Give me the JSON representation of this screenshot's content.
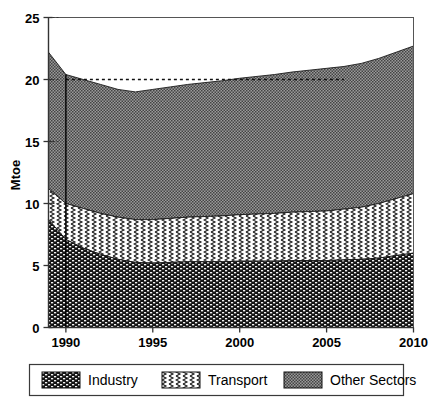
{
  "chart_data": {
    "type": "area",
    "stacked": true,
    "title": "",
    "xlabel": "",
    "ylabel": "Mtoe",
    "xlim": [
      1989,
      2010
    ],
    "ylim": [
      0,
      25
    ],
    "yticks": [
      0,
      5,
      10,
      15,
      20,
      25
    ],
    "xticks": [
      1990,
      1995,
      2000,
      2005,
      2010
    ],
    "grid": false,
    "legend_position": "bottom",
    "x": [
      1989,
      1990,
      1991,
      1992,
      1993,
      1994,
      1995,
      1996,
      1997,
      1998,
      1999,
      2000,
      2001,
      2002,
      2003,
      2004,
      2005,
      2006,
      2007,
      2008,
      2009,
      2010
    ],
    "series": [
      {
        "name": "Industry",
        "pattern": "dark-brick",
        "color": "#2b2b2b",
        "values": [
          8.7,
          7.1,
          6.4,
          5.9,
          5.5,
          5.25,
          5.2,
          5.25,
          5.3,
          5.3,
          5.3,
          5.35,
          5.35,
          5.35,
          5.4,
          5.4,
          5.4,
          5.45,
          5.5,
          5.6,
          5.8,
          6.0
        ]
      },
      {
        "name": "Transport",
        "pattern": "white-zigzag",
        "color": "#ffffff",
        "values": [
          2.5,
          2.9,
          3.2,
          3.3,
          3.4,
          3.45,
          3.5,
          3.55,
          3.6,
          3.65,
          3.7,
          3.75,
          3.8,
          3.85,
          3.9,
          3.95,
          4.0,
          4.1,
          4.2,
          4.4,
          4.6,
          4.8
        ]
      },
      {
        "name": "Other Sectors",
        "pattern": "gray-stipple",
        "color": "#8a8a8a",
        "values": [
          11.0,
          10.4,
          10.4,
          10.4,
          10.3,
          10.3,
          10.5,
          10.6,
          10.7,
          10.8,
          10.9,
          11.0,
          11.1,
          11.2,
          11.3,
          11.4,
          11.5,
          11.5,
          11.6,
          11.7,
          11.8,
          11.9
        ]
      }
    ],
    "totals": [
      22.2,
      20.4,
      20.0,
      19.6,
      19.2,
      19.0,
      19.2,
      19.4,
      19.6,
      19.75,
      19.9,
      20.1,
      20.25,
      20.4,
      20.6,
      20.75,
      20.9,
      21.05,
      21.3,
      21.7,
      22.2,
      22.7
    ],
    "annotations": [
      {
        "type": "dashed-reference-line",
        "y": 20,
        "x_start": 1990,
        "x_end": 2006
      },
      {
        "type": "vertical-line",
        "x": 1990
      }
    ]
  },
  "axis": {
    "ylabel": "Mtoe",
    "ytick_labels": [
      "25",
      "20",
      "15",
      "10",
      "5",
      "0"
    ],
    "xtick_labels": [
      "1990",
      "1995",
      "2000",
      "2005",
      "2010"
    ]
  },
  "legend": {
    "items": [
      {
        "label": "Industry",
        "swatch": "dark-brick"
      },
      {
        "label": "Transport",
        "swatch": "white-zigzag"
      },
      {
        "label": "Other Sectors",
        "swatch": "gray-stipple"
      }
    ]
  }
}
